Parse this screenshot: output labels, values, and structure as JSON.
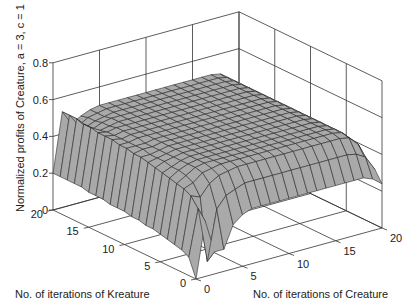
{
  "chart_data": {
    "type": "surface3d",
    "title": "",
    "xlabel": "No. of iterations of Creature",
    "ylabel": "No. of iterations of Kreature",
    "zlabel": "Normalized profits of Creature, a = 3, c = 1",
    "x_ticks": [
      "0",
      "5",
      "10",
      "15",
      "20"
    ],
    "y_ticks": [
      "0",
      "5",
      "10",
      "15",
      "20"
    ],
    "z_ticks": [
      "0",
      "0.2",
      "0.4",
      "0.6",
      "0.8"
    ],
    "xlim": [
      0,
      20
    ],
    "ylim": [
      0,
      20
    ],
    "zlim": [
      0,
      0.8
    ],
    "grid": true,
    "surface_color": "#a9a9a9",
    "edge_color": "#2a2a2a",
    "z_description": "Rows indexed by Kreature iterations 0..20, columns by Creature iterations 0..20 (estimated)",
    "z": [
      [
        0.0,
        0.3,
        0.12,
        0.12,
        0.24,
        0.28,
        0.3,
        0.3,
        0.3,
        0.3,
        0.3,
        0.3,
        0.3,
        0.3,
        0.3,
        0.3,
        0.3,
        0.3,
        0.3,
        0.28,
        0.24
      ],
      [
        0.1,
        0.35,
        0.05,
        0.32,
        0.38,
        0.4,
        0.42,
        0.42,
        0.42,
        0.42,
        0.42,
        0.42,
        0.42,
        0.42,
        0.42,
        0.42,
        0.42,
        0.42,
        0.41,
        0.38,
        0.3
      ],
      [
        0.12,
        0.4,
        0.38,
        0.44,
        0.47,
        0.48,
        0.49,
        0.49,
        0.49,
        0.49,
        0.49,
        0.49,
        0.49,
        0.49,
        0.49,
        0.49,
        0.49,
        0.49,
        0.48,
        0.43,
        0.31
      ],
      [
        0.13,
        0.42,
        0.44,
        0.48,
        0.49,
        0.5,
        0.5,
        0.5,
        0.5,
        0.5,
        0.5,
        0.5,
        0.5,
        0.5,
        0.5,
        0.5,
        0.5,
        0.5,
        0.49,
        0.44,
        0.31
      ],
      [
        0.14,
        0.43,
        0.46,
        0.49,
        0.5,
        0.5,
        0.5,
        0.5,
        0.5,
        0.5,
        0.5,
        0.5,
        0.5,
        0.5,
        0.5,
        0.5,
        0.5,
        0.5,
        0.49,
        0.44,
        0.31
      ],
      [
        0.15,
        0.44,
        0.47,
        0.49,
        0.5,
        0.5,
        0.5,
        0.5,
        0.5,
        0.5,
        0.5,
        0.5,
        0.5,
        0.5,
        0.5,
        0.5,
        0.5,
        0.5,
        0.49,
        0.44,
        0.31
      ],
      [
        0.16,
        0.45,
        0.47,
        0.49,
        0.5,
        0.5,
        0.5,
        0.5,
        0.5,
        0.5,
        0.5,
        0.5,
        0.5,
        0.5,
        0.5,
        0.5,
        0.5,
        0.5,
        0.49,
        0.44,
        0.31
      ],
      [
        0.16,
        0.46,
        0.48,
        0.49,
        0.5,
        0.5,
        0.5,
        0.5,
        0.5,
        0.5,
        0.5,
        0.5,
        0.5,
        0.5,
        0.5,
        0.5,
        0.5,
        0.5,
        0.49,
        0.44,
        0.31
      ],
      [
        0.17,
        0.47,
        0.48,
        0.49,
        0.5,
        0.5,
        0.5,
        0.5,
        0.5,
        0.5,
        0.5,
        0.5,
        0.5,
        0.5,
        0.5,
        0.5,
        0.5,
        0.5,
        0.49,
        0.44,
        0.31
      ],
      [
        0.17,
        0.48,
        0.48,
        0.49,
        0.5,
        0.5,
        0.5,
        0.5,
        0.5,
        0.5,
        0.5,
        0.5,
        0.5,
        0.5,
        0.5,
        0.5,
        0.5,
        0.5,
        0.49,
        0.44,
        0.31
      ],
      [
        0.18,
        0.48,
        0.49,
        0.49,
        0.5,
        0.5,
        0.5,
        0.5,
        0.5,
        0.5,
        0.5,
        0.5,
        0.5,
        0.5,
        0.5,
        0.5,
        0.5,
        0.5,
        0.49,
        0.44,
        0.31
      ],
      [
        0.18,
        0.49,
        0.49,
        0.49,
        0.5,
        0.5,
        0.5,
        0.5,
        0.5,
        0.5,
        0.5,
        0.5,
        0.5,
        0.5,
        0.5,
        0.5,
        0.5,
        0.5,
        0.49,
        0.44,
        0.31
      ],
      [
        0.18,
        0.49,
        0.49,
        0.5,
        0.5,
        0.5,
        0.5,
        0.5,
        0.5,
        0.5,
        0.5,
        0.5,
        0.5,
        0.5,
        0.5,
        0.5,
        0.5,
        0.5,
        0.49,
        0.44,
        0.31
      ],
      [
        0.19,
        0.5,
        0.49,
        0.5,
        0.5,
        0.5,
        0.5,
        0.5,
        0.5,
        0.5,
        0.5,
        0.5,
        0.5,
        0.5,
        0.5,
        0.5,
        0.5,
        0.5,
        0.49,
        0.44,
        0.31
      ],
      [
        0.19,
        0.5,
        0.49,
        0.5,
        0.5,
        0.5,
        0.5,
        0.5,
        0.5,
        0.5,
        0.5,
        0.5,
        0.5,
        0.5,
        0.5,
        0.5,
        0.5,
        0.5,
        0.49,
        0.44,
        0.31
      ],
      [
        0.19,
        0.5,
        0.49,
        0.5,
        0.5,
        0.5,
        0.5,
        0.5,
        0.5,
        0.5,
        0.5,
        0.5,
        0.5,
        0.5,
        0.5,
        0.5,
        0.5,
        0.5,
        0.49,
        0.44,
        0.31
      ],
      [
        0.2,
        0.51,
        0.48,
        0.49,
        0.5,
        0.5,
        0.5,
        0.5,
        0.5,
        0.5,
        0.5,
        0.5,
        0.5,
        0.5,
        0.5,
        0.5,
        0.5,
        0.5,
        0.49,
        0.44,
        0.31
      ],
      [
        0.2,
        0.51,
        0.47,
        0.49,
        0.5,
        0.5,
        0.5,
        0.5,
        0.5,
        0.5,
        0.5,
        0.5,
        0.5,
        0.5,
        0.5,
        0.5,
        0.5,
        0.5,
        0.49,
        0.44,
        0.31
      ],
      [
        0.2,
        0.52,
        0.46,
        0.48,
        0.49,
        0.5,
        0.5,
        0.5,
        0.5,
        0.5,
        0.5,
        0.5,
        0.5,
        0.5,
        0.5,
        0.5,
        0.5,
        0.5,
        0.49,
        0.44,
        0.31
      ],
      [
        0.2,
        0.52,
        0.45,
        0.48,
        0.49,
        0.5,
        0.5,
        0.5,
        0.5,
        0.5,
        0.5,
        0.5,
        0.5,
        0.5,
        0.5,
        0.5,
        0.5,
        0.5,
        0.49,
        0.44,
        0.31
      ],
      [
        0.2,
        0.52,
        0.44,
        0.47,
        0.49,
        0.5,
        0.5,
        0.5,
        0.5,
        0.5,
        0.5,
        0.5,
        0.5,
        0.5,
        0.5,
        0.5,
        0.5,
        0.5,
        0.49,
        0.44,
        0.31
      ]
    ]
  }
}
